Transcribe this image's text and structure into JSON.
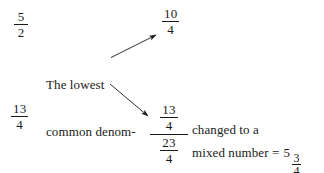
{
  "document": {
    "title": "Lowest common denominator worked example",
    "background_color": "#ffffff",
    "ink_color": "#1a1a1a"
  },
  "fractions": {
    "original_first": {
      "numerator": "5",
      "denominator": "2"
    },
    "original_second": {
      "numerator": "13",
      "denominator": "4"
    },
    "converted_first": {
      "numerator": "10",
      "denominator": "4"
    },
    "addend_second": {
      "numerator": "13",
      "denominator": "4"
    },
    "sum": {
      "numerator": "23",
      "denominator": "4"
    }
  },
  "annotation": {
    "line_1": "The lowest",
    "line_2": "common denom-",
    "line_3": "nator is 4"
  },
  "result": {
    "changed_to_text": "changed to a",
    "mixed_number_text": "mixed number =",
    "whole_part": "5",
    "fraction_numerator": "3",
    "fraction_denominator": "4"
  },
  "arrows": [
    {
      "name": "arrow-to-converted-first",
      "direction": "up-right"
    },
    {
      "name": "arrow-to-addend-second",
      "direction": "down-right"
    }
  ]
}
